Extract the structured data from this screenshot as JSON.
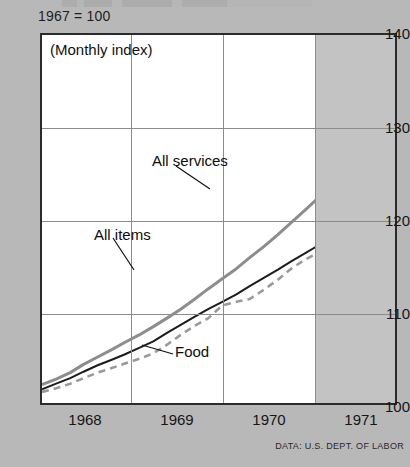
{
  "base_note": "1967 = 100",
  "subtitle": "(Monthly index)",
  "source": "DATA: U.S. DEPT. OF LABOR",
  "axis": {
    "y_ticks": [
      "140",
      "130",
      "120",
      "110",
      "100"
    ],
    "x_ticks": [
      "1968",
      "1969",
      "1970",
      "1971"
    ]
  },
  "labels": {
    "all_services": "All services",
    "all_items": "All items",
    "food": "Food"
  },
  "colors": {
    "all_services": "#8d8d8d",
    "all_items": "#1c1c1c",
    "food": "#9a9a9a",
    "plot_background": "#ffffff",
    "shaded_band": "#c3c3c3",
    "page_background": "#b8b8b8",
    "grid": "#8c8c8c",
    "frame": "#2b2b2b"
  },
  "chart_data": {
    "type": "line",
    "title": "",
    "subtitle": "(Monthly index)",
    "xlabel": "",
    "ylabel": "",
    "ylim": [
      100,
      140
    ],
    "xlim": [
      1967.58,
      1971.83
    ],
    "grid": true,
    "legend": "inline-annotations",
    "y_ticks": [
      100,
      110,
      120,
      130,
      140
    ],
    "x_ticks": [
      1968,
      1969,
      1970,
      1971
    ],
    "shaded_region": {
      "from": 1970.83,
      "to": 1971.83,
      "color": "#c3c3c3"
    },
    "x": [
      1967.58,
      1967.75,
      1967.92,
      1968.08,
      1968.25,
      1968.42,
      1968.58,
      1968.75,
      1968.92,
      1969.08,
      1969.25,
      1969.42,
      1969.58,
      1969.75,
      1969.92,
      1970.08,
      1970.25,
      1970.42,
      1970.58,
      1970.75,
      1970.92,
      1971.08,
      1971.25,
      1971.42,
      1971.58,
      1971.75
    ],
    "series": [
      {
        "name": "All services",
        "color": "#8d8d8d",
        "style": "solid",
        "values": [
          102.0,
          102.6,
          103.3,
          104.2,
          105.0,
          105.8,
          106.6,
          107.4,
          108.3,
          109.2,
          110.2,
          111.3,
          112.4,
          113.5,
          114.6,
          115.8,
          117.0,
          118.3,
          119.6,
          121.0,
          122.4,
          124.0,
          125.6,
          127.1,
          128.6,
          130.0
        ]
      },
      {
        "name": "All items",
        "color": "#1c1c1c",
        "style": "solid",
        "values": [
          101.5,
          102.1,
          102.7,
          103.4,
          104.1,
          104.7,
          105.3,
          106.0,
          106.7,
          107.6,
          108.5,
          109.4,
          110.2,
          111.0,
          111.8,
          112.7,
          113.6,
          114.5,
          115.4,
          116.3,
          117.2,
          118.6,
          119.6,
          120.4,
          121.3,
          123.2
        ]
      },
      {
        "name": "Food",
        "color": "#9a9a9a",
        "style": "dashed",
        "values": [
          101.2,
          101.6,
          102.1,
          102.7,
          103.3,
          103.8,
          104.3,
          104.8,
          105.4,
          106.3,
          107.4,
          108.4,
          109.2,
          110.6,
          111.0,
          111.3,
          112.3,
          113.4,
          114.6,
          115.6,
          116.4,
          117.6,
          118.0,
          119.4,
          119.8,
          119.9
        ]
      }
    ]
  }
}
